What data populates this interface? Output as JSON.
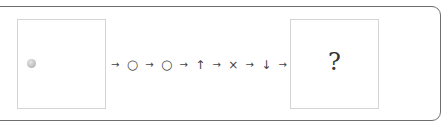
{
  "diagram": {
    "start_panel": {
      "content": "gray-ball"
    },
    "sequence": [
      {
        "type": "arrow",
        "glyph": "→"
      },
      {
        "type": "symbol",
        "glyph": "○",
        "name": "circle"
      },
      {
        "type": "arrow",
        "glyph": "→"
      },
      {
        "type": "symbol",
        "glyph": "○",
        "name": "circle"
      },
      {
        "type": "arrow",
        "glyph": "→"
      },
      {
        "type": "symbol",
        "glyph": "↑",
        "name": "up-arrow"
      },
      {
        "type": "arrow",
        "glyph": "→"
      },
      {
        "type": "symbol",
        "glyph": "×",
        "name": "cross"
      },
      {
        "type": "arrow",
        "glyph": "→"
      },
      {
        "type": "symbol",
        "glyph": "↓",
        "name": "down-arrow"
      },
      {
        "type": "arrow",
        "glyph": "→"
      }
    ],
    "end_panel": {
      "label": "?"
    }
  },
  "colors": {
    "frame_border": "#6e6e6e",
    "panel_border": "#d4d4d4",
    "ball": "#b9b9b9",
    "text": "#444444"
  }
}
